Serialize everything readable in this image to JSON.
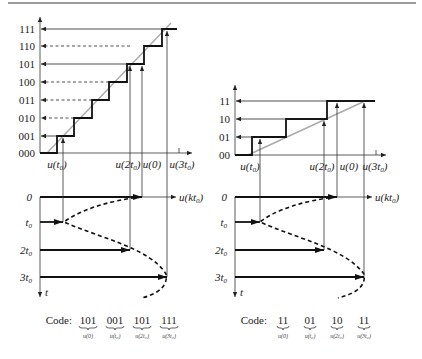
{
  "left": {
    "levels": [
      "000",
      "001",
      "010",
      "011",
      "100",
      "101",
      "110",
      "111"
    ],
    "x_labels": [
      {
        "base": "u(t",
        "sub": "0",
        "end": ")"
      },
      {
        "base": "u(2t",
        "sub": "0",
        "end": ")"
      },
      {
        "base": "u(0)",
        "sub": "",
        "end": ""
      },
      {
        "base": "u(3t",
        "sub": "0",
        "end": ")"
      }
    ],
    "axis_label": {
      "base": "u(kt",
      "sub": "0",
      "end": ")"
    },
    "time_labels": [
      {
        "base": "0",
        "sub": ""
      },
      {
        "base": "t",
        "sub": "0"
      },
      {
        "base": "2t",
        "sub": "0"
      },
      {
        "base": "3t",
        "sub": "0"
      }
    ],
    "t_axis": "t",
    "code_label": "Code:",
    "codes": [
      {
        "value": "101",
        "under": "u(0)"
      },
      {
        "value": "001",
        "under": "u(t₀)"
      },
      {
        "value": "101",
        "under": "u(2t₀)"
      },
      {
        "value": "111",
        "under": "u(3t₀)"
      }
    ]
  },
  "right": {
    "levels": [
      "00",
      "01",
      "10",
      "11"
    ],
    "x_labels": [
      {
        "base": "u(t",
        "sub": "0",
        "end": ")"
      },
      {
        "base": "u(2t",
        "sub": "0",
        "end": ")"
      },
      {
        "base": "u(0)",
        "sub": "",
        "end": ""
      },
      {
        "base": "u(3t",
        "sub": "0",
        "end": ")"
      }
    ],
    "axis_label": {
      "base": "u(kt",
      "sub": "0",
      "end": ")"
    },
    "time_labels": [
      {
        "base": "0",
        "sub": ""
      },
      {
        "base": "t",
        "sub": "0"
      },
      {
        "base": "2t",
        "sub": "0"
      },
      {
        "base": "3t",
        "sub": "0"
      }
    ],
    "t_axis": "t",
    "code_label": "Code:",
    "codes": [
      {
        "value": "11",
        "under": "u(0)"
      },
      {
        "value": "01",
        "under": "u(t₀)"
      },
      {
        "value": "10",
        "under": "u(2t₀)"
      },
      {
        "value": "11",
        "under": "u(3t₀)"
      }
    ]
  }
}
